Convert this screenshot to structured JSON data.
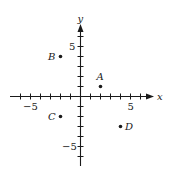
{
  "chart_data": {
    "type": "scatter",
    "title": "",
    "xlabel": "x",
    "ylabel": "y",
    "xlim": [
      -6,
      6
    ],
    "ylim": [
      -6,
      6
    ],
    "grid": false,
    "x_tick_labels": [
      {
        "value": -5,
        "label": "−5"
      },
      {
        "value": 5,
        "label": "5"
      }
    ],
    "y_tick_labels": [
      {
        "value": 5,
        "label": "5"
      },
      {
        "value": -5,
        "label": "−5"
      }
    ],
    "points": [
      {
        "label": "A",
        "x": 2,
        "y": 1
      },
      {
        "label": "B",
        "x": -2,
        "y": 4
      },
      {
        "label": "C",
        "x": -2,
        "y": -2
      },
      {
        "label": "D",
        "x": 4,
        "y": -3
      }
    ]
  },
  "axes": {
    "x_label": "x",
    "y_label": "y",
    "x_tick_min_label": "−5",
    "x_tick_max_label": "5",
    "y_tick_max_label": "5",
    "y_tick_min_label": "−5"
  },
  "points": {
    "A": "A",
    "B": "B",
    "C": "C",
    "D": "D"
  }
}
